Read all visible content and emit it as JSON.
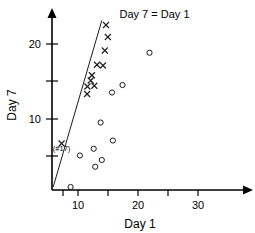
{
  "chart_data": {
    "type": "scatter",
    "title": "",
    "xlabel": "Day 1",
    "ylabel": "Day 7",
    "xlim": [
      0,
      35
    ],
    "ylim": [
      0,
      23.5
    ],
    "grid": false,
    "legend": "none",
    "xticks": [
      5,
      10,
      15,
      20,
      25,
      30
    ],
    "xtick_labels": [
      "",
      "10",
      "",
      "20",
      "",
      "30"
    ],
    "yticks": [
      10,
      15,
      20
    ],
    "ytick_labels": [
      "10",
      "15",
      "20"
    ],
    "annotations": [
      {
        "name": "identity-line-label",
        "text": "Day 7 = Day 1",
        "x": 22.5,
        "y": 23.0
      },
      {
        "name": "point-17-label",
        "text": "(#17)",
        "x": 3.2,
        "y": 5.2
      }
    ],
    "reference_line": {
      "name": "Day 7 = Day 1",
      "type": "identity",
      "x_start": 0.4,
      "y_start": 0.4,
      "x_end": 16.6,
      "y_end": 22.6
    },
    "series": [
      {
        "name": "x-markers",
        "marker": "x",
        "points": [
          [
            3.2,
            6.2
          ],
          [
            11.7,
            12.8
          ],
          [
            11.8,
            13.8
          ],
          [
            12.9,
            14.6
          ],
          [
            13.3,
            15.3
          ],
          [
            14.1,
            13.9
          ],
          [
            15.0,
            16.7
          ],
          [
            17.0,
            16.6
          ],
          [
            17.6,
            18.6
          ],
          [
            18.0,
            22.0
          ],
          [
            18.6,
            20.4
          ]
        ]
      },
      {
        "name": "o-markers",
        "marker": "o",
        "points": [
          [
            6.2,
            0.4
          ],
          [
            9.3,
            4.6
          ],
          [
            13.9,
            5.5
          ],
          [
            14.4,
            3.1
          ],
          [
            16.6,
            4.0
          ],
          [
            16.2,
            9.0
          ],
          [
            20.0,
            13.0
          ],
          [
            20.3,
            6.6
          ],
          [
            23.5,
            14.0
          ],
          [
            32.5,
            18.3
          ]
        ]
      }
    ]
  },
  "axes": {
    "x_title": "Day 1",
    "y_title": "Day 7"
  }
}
